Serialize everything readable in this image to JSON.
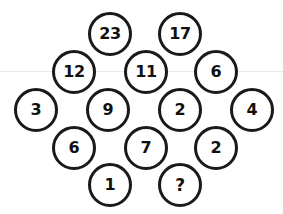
{
  "puzzle": {
    "type": "number-circle-grid",
    "shape": "diamond",
    "unknown_marker": "?",
    "rule_line_color": "#e9e9e9",
    "circle_stroke_color": "#1a1a1a",
    "circle_fill_color": "#ffffff",
    "text_color": "#111111",
    "rows": [
      {
        "name": "row-1",
        "y": 34,
        "cells": [
          {
            "name": "cell-23",
            "value": "23",
            "x": 110
          },
          {
            "name": "cell-17",
            "value": "17",
            "x": 180
          }
        ]
      },
      {
        "name": "row-2",
        "y": 72,
        "cells": [
          {
            "name": "cell-12",
            "value": "12",
            "x": 74
          },
          {
            "name": "cell-11",
            "value": "11",
            "x": 146
          },
          {
            "name": "cell-6-top",
            "value": "6",
            "x": 216
          }
        ]
      },
      {
        "name": "row-3",
        "y": 110,
        "cells": [
          {
            "name": "cell-3",
            "value": "3",
            "x": 36
          },
          {
            "name": "cell-9",
            "value": "9",
            "x": 108
          },
          {
            "name": "cell-2-middle",
            "value": "2",
            "x": 180
          },
          {
            "name": "cell-4",
            "value": "4",
            "x": 252
          }
        ]
      },
      {
        "name": "row-4",
        "y": 148,
        "cells": [
          {
            "name": "cell-6-bottom",
            "value": "6",
            "x": 74
          },
          {
            "name": "cell-7",
            "value": "7",
            "x": 146
          },
          {
            "name": "cell-2-bottom",
            "value": "2",
            "x": 216
          }
        ]
      },
      {
        "name": "row-5",
        "y": 185,
        "cells": [
          {
            "name": "cell-1",
            "value": "1",
            "x": 110
          },
          {
            "name": "cell-unknown",
            "value": "?",
            "x": 180
          }
        ]
      }
    ],
    "guide_rule": {
      "name": "horizontal-guide-rule",
      "y": 71
    }
  }
}
